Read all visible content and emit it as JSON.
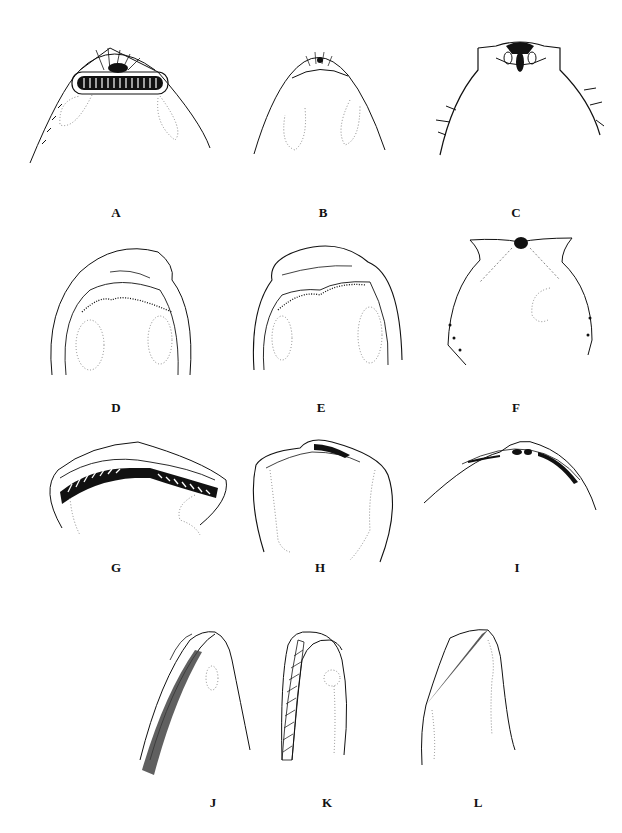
{
  "figure": {
    "panels": [
      {
        "id": "A",
        "label": "A"
      },
      {
        "id": "B",
        "label": "B"
      },
      {
        "id": "C",
        "label": "C"
      },
      {
        "id": "D",
        "label": "D"
      },
      {
        "id": "E",
        "label": "E"
      },
      {
        "id": "F",
        "label": "F"
      },
      {
        "id": "G",
        "label": "G"
      },
      {
        "id": "H",
        "label": "H"
      },
      {
        "id": "I",
        "label": "I"
      },
      {
        "id": "J",
        "label": "J"
      },
      {
        "id": "K",
        "label": "K"
      },
      {
        "id": "L",
        "label": "L"
      }
    ],
    "colors": {
      "ink": "#111111",
      "dotted": "#888888",
      "background": "#ffffff"
    }
  }
}
